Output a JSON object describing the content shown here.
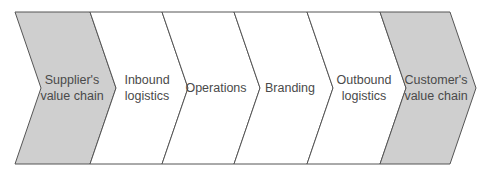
{
  "diagram": {
    "type": "value-chain",
    "colors": {
      "external_fill": "#cfcfcf",
      "internal_fill": "#ffffff",
      "stroke": "#555555",
      "text": "#4a4a4a"
    },
    "stages": [
      {
        "id": "suppliers-value-chain",
        "line1": "Supplier's",
        "line2": "value chain",
        "external": true
      },
      {
        "id": "inbound-logistics",
        "line1": "Inbound",
        "line2": "logistics",
        "external": false
      },
      {
        "id": "operations",
        "line1": "Operations",
        "line2": "",
        "external": false
      },
      {
        "id": "branding",
        "line1": "Branding",
        "line2": "",
        "external": false
      },
      {
        "id": "outbound-logistics",
        "line1": "Outbound",
        "line2": "logistics",
        "external": false
      },
      {
        "id": "customers-value-chain",
        "line1": "Customer's",
        "line2": "value chain",
        "external": true
      }
    ]
  }
}
